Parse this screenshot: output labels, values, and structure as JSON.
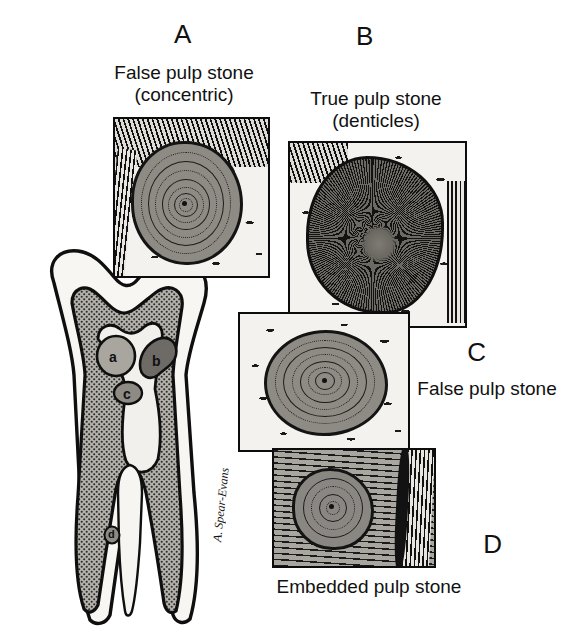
{
  "figure": {
    "background_color": "#ffffff",
    "ink_color": "#111111"
  },
  "panels": [
    {
      "id": "A",
      "letter": "A",
      "caption_line1": "False pulp stone",
      "caption_line2": "(concentric)",
      "description": "Concentric lamellated pulp stone surrounded by pulp tissue and dentin",
      "stone_type": "concentric",
      "ring_count": 7
    },
    {
      "id": "B",
      "letter": "B",
      "caption_line1": "True pulp stone",
      "caption_line2": "(denticles)",
      "description": "True denticle with radiating dentinal tubules",
      "stone_type": "radial",
      "ring_count": 0
    },
    {
      "id": "C",
      "letter": "C",
      "caption_line1": "False pulp stone",
      "caption_line2": "",
      "description": "Oval false pulp stone with concentric laminations in pulp tissue",
      "stone_type": "concentric",
      "ring_count": 6
    },
    {
      "id": "D",
      "letter": "D",
      "caption_line1": "Embedded pulp stone",
      "caption_line2": "",
      "description": "Pulp stone embedded within dentin wall",
      "stone_type": "embedded",
      "ring_count": 4
    }
  ],
  "tooth_diagram": {
    "name": "molar-cross-section",
    "stone_labels": [
      {
        "key": "a",
        "text": "a",
        "note": "free pulp stone in coronal pulp chamber"
      },
      {
        "key": "b",
        "text": "b",
        "note": "attached pulp stone on chamber wall"
      },
      {
        "key": "c",
        "text": "c",
        "note": "free pulp stone in coronal pulp chamber"
      },
      {
        "key": "d",
        "text": "d",
        "note": "embedded pulp stone in root canal dentin"
      }
    ],
    "signature": "A. Spear-Evans"
  },
  "colors": {
    "enamel": "#f6f5f2",
    "dentin": "#9b9891",
    "pulp": "#efede9",
    "stone_light": "#a9a6a0",
    "stone_dark": "#6e6b66",
    "outline": "#111111"
  }
}
